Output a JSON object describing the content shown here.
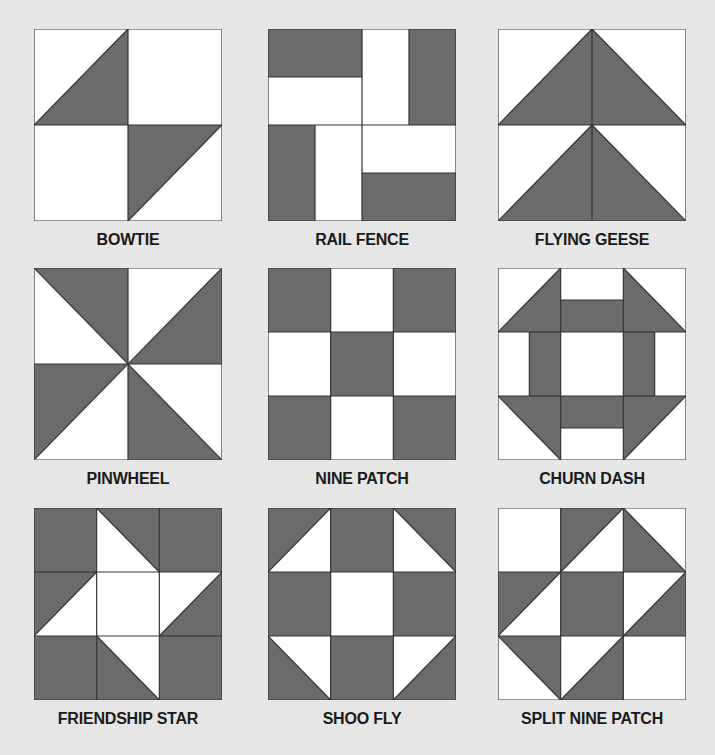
{
  "colors": {
    "background": "#e6e6e6",
    "dark_fabric": "#6b6b6b",
    "light_fabric": "#ffffff",
    "outline": "#333333",
    "label_text": "#1a1a1a"
  },
  "blocks": [
    {
      "name": "BOWTIE",
      "grid": "2x2",
      "row": 1,
      "col": 1
    },
    {
      "name": "RAIL FENCE",
      "grid": "2x2",
      "row": 1,
      "col": 2
    },
    {
      "name": "FLYING GEESE",
      "grid": "2x2",
      "row": 1,
      "col": 3
    },
    {
      "name": "PINWHEEL",
      "grid": "2x2",
      "row": 2,
      "col": 1
    },
    {
      "name": "NINE PATCH",
      "grid": "3x3",
      "row": 2,
      "col": 2
    },
    {
      "name": "CHURN DASH",
      "grid": "3x3",
      "row": 2,
      "col": 3
    },
    {
      "name": "FRIENDSHIP STAR",
      "grid": "3x3",
      "row": 3,
      "col": 1
    },
    {
      "name": "SHOO FLY",
      "grid": "3x3",
      "row": 3,
      "col": 2
    },
    {
      "name": "SPLIT NINE PATCH",
      "grid": "3x3",
      "row": 3,
      "col": 3
    }
  ]
}
